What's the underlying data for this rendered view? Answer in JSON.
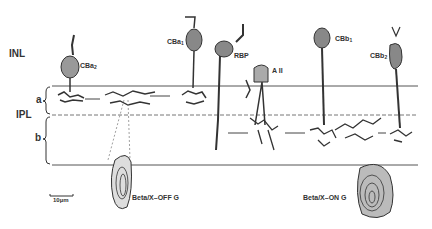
{
  "layers": {
    "inl": "INL",
    "ipl": "IPL",
    "sublamina_a": "a",
    "sublamina_b": "b"
  },
  "cells": {
    "cba2": {
      "name": "CBa",
      "sub": "2"
    },
    "cba1": {
      "name": "CBa",
      "sub": "1"
    },
    "rbp": {
      "name": "RBP"
    },
    "aii": {
      "name": "A II"
    },
    "cbb1": {
      "name": "CBb",
      "sub": "1"
    },
    "cbb2": {
      "name": "CBb",
      "sub": "2"
    },
    "beta_off": {
      "name": "Beta/X–OFF G"
    },
    "beta_on": {
      "name": "Beta/X–ON G"
    }
  },
  "scale_bar": {
    "label": "10µm"
  },
  "colors": {
    "ink": "#333333",
    "background": "#ffffff"
  }
}
